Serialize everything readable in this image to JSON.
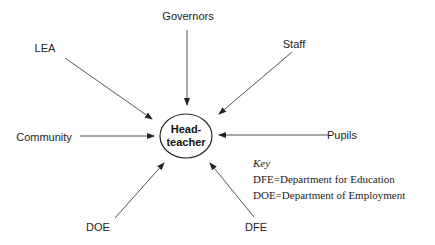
{
  "diagram": {
    "center": {
      "line1": "Head-",
      "line2": "teacher"
    },
    "nodes": [
      {
        "id": "governors",
        "label": "Governors"
      },
      {
        "id": "lea",
        "label": "LEA"
      },
      {
        "id": "staff",
        "label": "Staff"
      },
      {
        "id": "community",
        "label": "Community"
      },
      {
        "id": "pupils",
        "label": "Pupils"
      },
      {
        "id": "doe",
        "label": "DOE"
      },
      {
        "id": "dfe",
        "label": "DFE"
      }
    ],
    "edges": [
      {
        "from": "governors",
        "to": "headteacher"
      },
      {
        "from": "lea",
        "to": "headteacher"
      },
      {
        "from": "staff",
        "to": "headteacher"
      },
      {
        "from": "community",
        "to": "headteacher"
      },
      {
        "from": "pupils",
        "to": "headteacher"
      },
      {
        "from": "doe",
        "to": "headteacher"
      },
      {
        "from": "dfe",
        "to": "headteacher"
      }
    ],
    "key": {
      "title": "Key",
      "entries": [
        "DFE=Department for Education",
        "DOE=Department of Employment"
      ]
    }
  }
}
